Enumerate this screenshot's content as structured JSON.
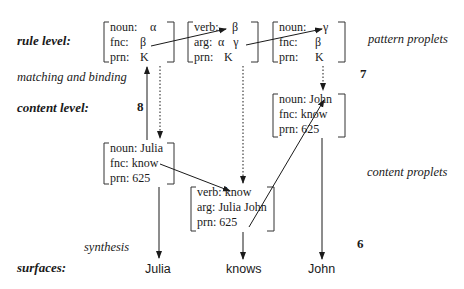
{
  "levels": {
    "rule": "rule level:",
    "content": "content level:",
    "surfaces": "surfaces:"
  },
  "annotations": {
    "matching": "matching and binding",
    "synthesis": "synthesis",
    "pattern": "pattern proplets",
    "content": "content proplets"
  },
  "step_numbers": {
    "n6": "6",
    "n7": "7",
    "n8": "8"
  },
  "pattern_proplets": [
    {
      "rows": [
        {
          "key": "noun:",
          "val": "α"
        },
        {
          "key": "fnc:",
          "val": "β"
        },
        {
          "key": "prn:",
          "val": "K"
        }
      ]
    },
    {
      "rows": [
        {
          "key": "verb:",
          "val": "β"
        },
        {
          "key": "arg:",
          "val": "α   γ"
        },
        {
          "key": "prn:",
          "val": "K"
        }
      ]
    },
    {
      "rows": [
        {
          "key": "noun:",
          "val": "γ"
        },
        {
          "key": "fnc:",
          "val": "β"
        },
        {
          "key": "prn:",
          "val": "K"
        }
      ]
    }
  ],
  "content_proplets": [
    {
      "rows": [
        "noun: Julia",
        "fnc: know",
        "prn: 625"
      ]
    },
    {
      "rows": [
        "verb: know",
        "arg: Julia John",
        "prn: 625"
      ]
    },
    {
      "rows": [
        "noun: John",
        "fnc: know",
        "prn: 625"
      ]
    }
  ],
  "surfaces": [
    "Julia",
    "knows",
    "John"
  ],
  "colors": {
    "ink": "#1a1a1a",
    "bracket": "#333333"
  }
}
